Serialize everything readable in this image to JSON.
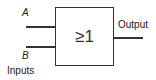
{
  "diagram": {
    "type": "logic-gate",
    "gate": "OR",
    "gate_symbol": "≥1",
    "inputs": [
      {
        "label": "A"
      },
      {
        "label": "B"
      }
    ],
    "inputs_caption": "Inputs",
    "output_label": "Output",
    "stroke_color": "#333333"
  }
}
